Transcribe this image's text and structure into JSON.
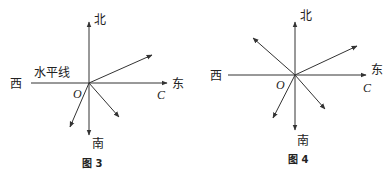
{
  "figures": [
    {
      "id": "fig3",
      "caption": "图 3",
      "origin_label": "O",
      "point_label": "C",
      "north": "北",
      "south": "南",
      "east": "东",
      "west": "西",
      "horizontal_label": "水平线",
      "arrows": [
        "north",
        "east",
        "south",
        "northeast",
        "southeast",
        "southwest"
      ]
    },
    {
      "id": "fig4",
      "caption": "图 4",
      "origin_label": "O",
      "point_label": "C",
      "north": "北",
      "south": "南",
      "east": "东",
      "west": "西",
      "arrows": [
        "north",
        "east",
        "south",
        "northwest",
        "northeast",
        "southeast",
        "southwest"
      ]
    }
  ]
}
